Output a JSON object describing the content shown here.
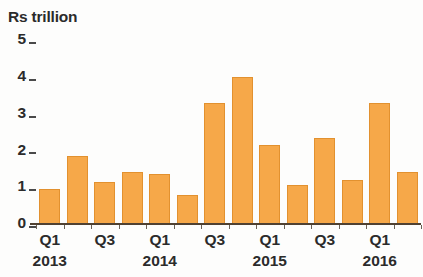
{
  "chart_data": {
    "type": "bar",
    "title": "Rs trillion",
    "xlabel": "",
    "ylabel": "Rs trillion",
    "ylim": [
      0,
      5
    ],
    "ytick_labels": [
      "5",
      "4",
      "3",
      "2",
      "1",
      "0"
    ],
    "ytick_values": [
      5,
      4,
      3,
      2,
      1,
      0
    ],
    "grid": false,
    "legend": null,
    "categories": [
      "Q1 2013",
      "Q2 2013",
      "Q3 2013",
      "Q4 2013",
      "Q1 2014",
      "Q2 2014",
      "Q3 2014",
      "Q4 2014",
      "Q1 2015",
      "Q2 2015",
      "Q3 2015",
      "Q4 2015",
      "Q1 2016",
      "Q2 2016"
    ],
    "values": [
      0.95,
      1.85,
      1.15,
      1.4,
      1.35,
      0.8,
      3.3,
      4.0,
      2.15,
      1.05,
      2.35,
      1.2,
      3.3,
      1.4
    ],
    "bar_color": "#f6a849",
    "bar_edge_color": "#e2912f",
    "axis_color": "#4f4132",
    "text_color": "#2b2b2b",
    "xtick_labels": [
      {
        "label": "Q1",
        "index": 0
      },
      {
        "label": "Q3",
        "index": 2
      },
      {
        "label": "Q1",
        "index": 4
      },
      {
        "label": "Q3",
        "index": 6
      },
      {
        "label": "Q1",
        "index": 8
      },
      {
        "label": "Q3",
        "index": 10
      },
      {
        "label": "Q1",
        "index": 12
      }
    ],
    "year_labels": [
      {
        "label": "2013",
        "index": 0
      },
      {
        "label": "2014",
        "index": 4
      },
      {
        "label": "2015",
        "index": 8
      },
      {
        "label": "2016",
        "index": 12
      }
    ]
  }
}
